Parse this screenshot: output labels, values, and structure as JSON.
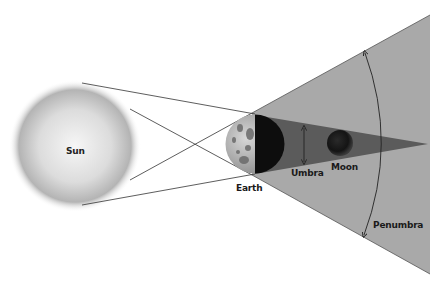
{
  "diagram": {
    "type": "lunar-eclipse-geometry",
    "labels": {
      "sun": "Sun",
      "earth": "Earth",
      "umbra": "Umbra",
      "moon": "Moon",
      "penumbra": "Penumbra"
    },
    "colors": {
      "background": "#ffffff",
      "sun_center": "#f4f4f4",
      "sun_edge": "#9a9a9a",
      "penumbra": "#a9a9a9",
      "umbra": "#5b5b5b",
      "moon": "#1c1c1c",
      "earth_lit": "#b8b8b8",
      "earth_dark": "#0d0d0d",
      "lines": "#333333"
    }
  }
}
